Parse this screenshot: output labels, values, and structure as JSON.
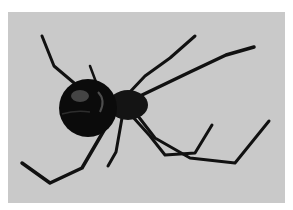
{
  "image": {
    "subject": "black widow spider",
    "description": "Black widow spider with glossy round black abdomen and long jointed legs on a plain light gray background",
    "colors": {
      "background": "#c9c9c9",
      "border": "#ffffff",
      "body": "#0d0d0d",
      "highlight": "#7a7a7a"
    }
  }
}
